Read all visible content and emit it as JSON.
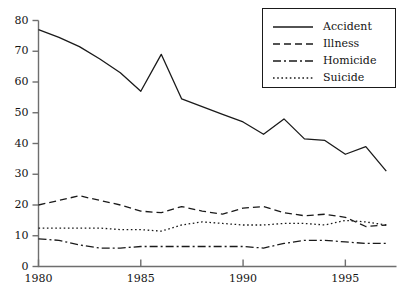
{
  "chart_data": {
    "type": "line",
    "title": "",
    "xlabel": "",
    "ylabel": "",
    "xlim": [
      1980,
      1997.5
    ],
    "ylim": [
      0,
      80
    ],
    "grid": false,
    "legend_position": "top-right",
    "x_ticks": [
      "1980",
      "1985",
      "1990",
      "1995"
    ],
    "x_tick_values": [
      1980,
      1985,
      1990,
      1995
    ],
    "y_ticks": [
      "0",
      "10",
      "20",
      "30",
      "40",
      "50",
      "60",
      "70",
      "80"
    ],
    "y_tick_values": [
      0,
      10,
      20,
      30,
      40,
      50,
      60,
      70,
      80
    ],
    "x": [
      1980,
      1981,
      1982,
      1983,
      1984,
      1985,
      1986,
      1987,
      1988,
      1989,
      1990,
      1991,
      1992,
      1993,
      1994,
      1995,
      1996,
      1997
    ],
    "series": [
      {
        "name": "Accident",
        "style": "solid",
        "values": [
          77.0,
          74.5,
          71.5,
          67.5,
          63.0,
          57.0,
          69.0,
          54.5,
          52.0,
          49.5,
          47.0,
          43.0,
          48.0,
          41.5,
          41.0,
          36.5,
          39.0,
          31.0
        ]
      },
      {
        "name": "Illness",
        "style": "dashed",
        "values": [
          20.0,
          21.5,
          23.0,
          21.5,
          20.0,
          18.0,
          17.5,
          19.5,
          18.0,
          17.0,
          19.0,
          19.5,
          17.5,
          16.5,
          17.0,
          16.0,
          13.0,
          13.5
        ]
      },
      {
        "name": "Homicide",
        "style": "dashdot",
        "values": [
          9.0,
          8.5,
          7.0,
          6.0,
          6.0,
          6.5,
          6.5,
          6.5,
          6.5,
          6.5,
          6.5,
          6.0,
          7.5,
          8.5,
          8.5,
          8.0,
          7.5,
          7.5
        ]
      },
      {
        "name": "Suicide",
        "style": "dotted",
        "values": [
          12.5,
          12.5,
          12.5,
          12.5,
          12.0,
          12.0,
          11.5,
          13.5,
          14.5,
          14.0,
          13.5,
          13.5,
          14.0,
          14.0,
          13.5,
          15.0,
          14.5,
          13.5
        ]
      }
    ]
  },
  "legend": {
    "entries": [
      {
        "label": "Accident"
      },
      {
        "label": "Illness"
      },
      {
        "label": "Homicide"
      },
      {
        "label": "Suicide"
      }
    ]
  },
  "colors": {
    "line": "#1a1a1a",
    "axis": "#6e6e6e",
    "background": "#ffffff"
  }
}
